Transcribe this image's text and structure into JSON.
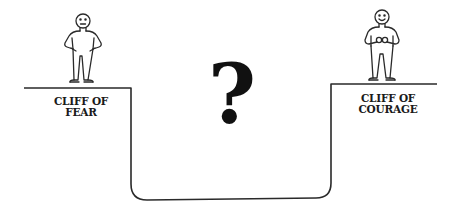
{
  "diagram": {
    "left_cliff": {
      "label_line1": "CLIFF OF",
      "label_line2": "FEAR",
      "figure": "worried-person"
    },
    "right_cliff": {
      "label_line1": "CLIFF OF",
      "label_line2": "COURAGE",
      "figure": "smiling-person"
    },
    "center_symbol": "?",
    "colors": {
      "line": "#2a2a2a",
      "background": "#ffffff"
    }
  }
}
